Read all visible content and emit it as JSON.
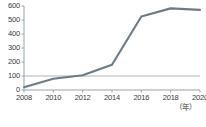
{
  "chart_data": {
    "type": "line",
    "title": "",
    "xlabel": "（年）",
    "ylabel": "",
    "x": [
      2008,
      2010,
      2012,
      2014,
      2016,
      2018,
      2020
    ],
    "categories": [
      "2008",
      "2010",
      "2012",
      "2014",
      "2016",
      "2018",
      "2020"
    ],
    "values": [
      20,
      80,
      105,
      180,
      525,
      583,
      572
    ],
    "series": [
      {
        "name": "",
        "values": [
          20,
          80,
          105,
          180,
          525,
          583,
          572
        ],
        "color": "#6d7b86"
      }
    ],
    "ylim": [
      0,
      600
    ],
    "xlim": [
      2008,
      2020
    ],
    "yticks": [
      0,
      100,
      200,
      300,
      400,
      500,
      600
    ],
    "ytick_labels": [
      "0",
      "100",
      "200",
      "300",
      "400",
      "500",
      "600"
    ],
    "xtick_labels": [
      "2008",
      "2010",
      "2012",
      "2014",
      "2016",
      "2018",
      "2020"
    ],
    "grid": false,
    "reference_line": {
      "value": 100,
      "color": "#9aa3aa"
    },
    "legend": "none",
    "axis_color": "#9aa3aa",
    "line_color": "#6d7b86"
  }
}
